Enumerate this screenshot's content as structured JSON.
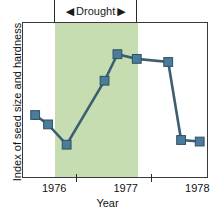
{
  "chart_data": {
    "type": "line",
    "title": "",
    "xlabel": "Year",
    "ylabel": "Index of seed size and hardness",
    "xlim": [
      1975.55,
      1978.15
    ],
    "ylim": [
      0,
      100
    ],
    "grid": false,
    "legend": null,
    "x_tick_labels": [
      "1976",
      "1977",
      "1978"
    ],
    "x_tick_label_positions": [
      1976.0,
      1977.0,
      1978.0
    ],
    "x_axis_ticks": [
      1976.3,
      1977.35
    ],
    "series": [
      {
        "name": "Index of seed size and hardness",
        "marker": "square",
        "color": "#4a7d99",
        "line_color": "#3d5e70",
        "x": [
          1975.72,
          1975.9,
          1976.16,
          1976.69,
          1976.87,
          1977.14,
          1977.58,
          1977.76,
          1978.02
        ],
        "values": [
          41,
          35,
          22,
          63,
          80,
          77,
          75,
          25,
          24
        ]
      }
    ],
    "annotations": [
      {
        "label": "Drought",
        "left_arrow": "◀",
        "right_arrow": "▶",
        "span_start": 1976.0,
        "span_end": 1977.16,
        "shaded_color": "#c5ddb0",
        "position": "top"
      }
    ]
  },
  "axis": {
    "x_title": "Year",
    "y_title": "Index of seed size and hardness",
    "ticks": [
      {
        "label": "1976"
      },
      {
        "label": "1977"
      },
      {
        "label": "1978"
      }
    ]
  },
  "annotation": {
    "drought_label": "Drought",
    "arrow_left": "◀",
    "arrow_right": "▶"
  },
  "colors": {
    "band": "#c5ddb0",
    "marker_fill": "#4a7d99",
    "marker_edge": "#2f5063",
    "line": "#3d5e70",
    "frame": "#3a3a3a",
    "text": "#111111"
  }
}
